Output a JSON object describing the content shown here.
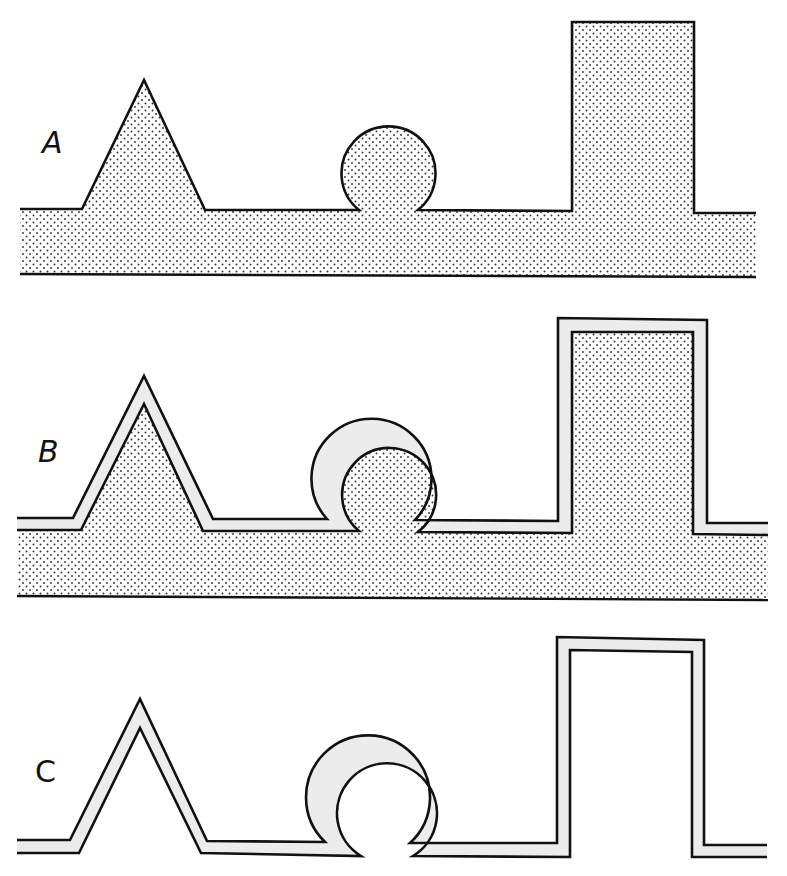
{
  "figure": {
    "colors": {
      "background": "#ffffff",
      "line": "#111111",
      "substrate_dots": "#333333",
      "film_layer": "#ececec"
    }
  },
  "panels": [
    {
      "id": "A",
      "label": "A",
      "description": "Dotted substrate with triangular ridge, circular knob on narrow neck, and tall rectangular block"
    },
    {
      "id": "B",
      "label": "B",
      "description": "Same substrate covered by a uniform conformal film layer"
    },
    {
      "id": "C",
      "label": "C",
      "description": "Free-standing film only, substrate removed"
    }
  ],
  "features": [
    "triangle",
    "circle",
    "rectangle"
  ]
}
